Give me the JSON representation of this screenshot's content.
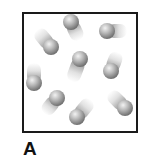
{
  "diagram": {
    "label": "A",
    "container": {
      "x": 22,
      "y": 12,
      "width": 116,
      "height": 121,
      "border_color": "#1a1a1a"
    },
    "particles": [
      {
        "x": 51,
        "y": 47,
        "trail_angle": 140,
        "trail_length": 22
      },
      {
        "x": 71,
        "y": 22,
        "trail_angle": -25,
        "trail_length": 20
      },
      {
        "x": 107,
        "y": 31,
        "trail_angle": -90,
        "trail_length": 20
      },
      {
        "x": 80,
        "y": 59,
        "trail_angle": 20,
        "trail_length": 24
      },
      {
        "x": 111,
        "y": 71,
        "trail_angle": -160,
        "trail_length": 20
      },
      {
        "x": 34,
        "y": 83,
        "trail_angle": 180,
        "trail_length": 20
      },
      {
        "x": 57,
        "y": 98,
        "trail_angle": 40,
        "trail_length": 20
      },
      {
        "x": 77,
        "y": 117,
        "trail_angle": -140,
        "trail_length": 22
      },
      {
        "x": 125,
        "y": 108,
        "trail_angle": 135,
        "trail_length": 22
      }
    ]
  }
}
